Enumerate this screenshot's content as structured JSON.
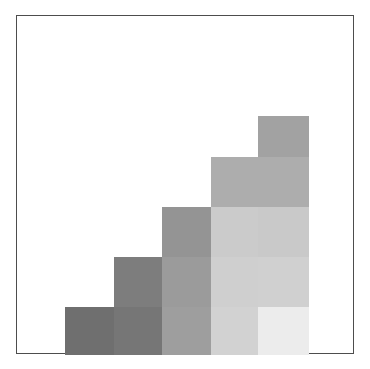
{
  "figure": {
    "title": "",
    "frame_color": "#4d4d4d",
    "background_color": "#ffffff",
    "plate_left": 16,
    "plate_top": 15,
    "plate_width": 338,
    "plate_height": 339
  },
  "chart_data": {
    "type": "bar",
    "title": "",
    "subtitle": "",
    "xlabel": "",
    "ylabel": "",
    "categories": [
      "1",
      "2",
      "3",
      "4",
      "5"
    ],
    "values": [
      48,
      98,
      148,
      198,
      239
    ],
    "ylim": [
      0,
      339
    ],
    "xlim": [
      0,
      338
    ],
    "grid": false,
    "legend": false,
    "legend_position": "none",
    "tick_labels_x": [],
    "tick_labels_y": [],
    "annotations": [],
    "note": "Five overlapping staircase rectangles, each shifted right, taller and lighter than the previous; overlaps render as layered horizontal bands.",
    "bars": [
      {
        "index": 1,
        "name": "step-1",
        "left": 48,
        "width": 49,
        "height": 48,
        "color": "#6f6f6f",
        "bands": [
          {
            "top": 0,
            "height": 48,
            "color": "#6f6f6f"
          }
        ]
      },
      {
        "index": 2,
        "name": "step-2",
        "left": 97,
        "width": 48,
        "height": 98,
        "color": "#808080",
        "bands": [
          {
            "top": 0,
            "height": 50,
            "color": "#7d7d7d"
          },
          {
            "top": 50,
            "height": 48,
            "color": "#767676"
          }
        ]
      },
      {
        "index": 3,
        "name": "step-3",
        "left": 145,
        "width": 49,
        "height": 148,
        "color": "#9a9a9a",
        "bands": [
          {
            "top": 0,
            "height": 50,
            "color": "#949494"
          },
          {
            "top": 50,
            "height": 50,
            "color": "#9b9b9b"
          },
          {
            "top": 100,
            "height": 48,
            "color": "#9e9e9e"
          }
        ]
      },
      {
        "index": 4,
        "name": "step-4",
        "left": 194,
        "width": 47,
        "height": 198,
        "color": "#c4c4c4",
        "bands": [
          {
            "top": 0,
            "height": 50,
            "color": "#adadad"
          },
          {
            "top": 50,
            "height": 50,
            "color": "#cbcbcb"
          },
          {
            "top": 100,
            "height": 50,
            "color": "#cfcfcf"
          },
          {
            "top": 150,
            "height": 48,
            "color": "#d2d2d2"
          }
        ]
      },
      {
        "index": 5,
        "name": "step-5",
        "left": 241,
        "width": 51,
        "height": 239,
        "color": "#dedede",
        "bands": [
          {
            "top": 0,
            "height": 41,
            "color": "#a2a2a2"
          },
          {
            "top": 41,
            "height": 50,
            "color": "#adadad"
          },
          {
            "top": 91,
            "height": 50,
            "color": "#c9c9c9"
          },
          {
            "top": 141,
            "height": 50,
            "color": "#d0d0d0"
          },
          {
            "top": 191,
            "height": 48,
            "color": "#ececec"
          }
        ]
      }
    ]
  }
}
